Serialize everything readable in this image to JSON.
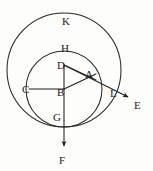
{
  "figure": {
    "background_color": "#fdfdfc",
    "ink_color": "#232020",
    "stroke_width": 1.0,
    "width": 153,
    "height": 171,
    "circles": [
      {
        "name": "outer-circle-K",
        "label": "K",
        "cx": 64,
        "cy": 70,
        "r": 57
      },
      {
        "name": "inner-circle-H",
        "label": "H",
        "cx": 64,
        "cy": 89,
        "r": 38
      }
    ],
    "points": [
      {
        "key": "K",
        "label": "K",
        "x": 62,
        "y": 16,
        "role": "outer-circle-label"
      },
      {
        "key": "H",
        "label": "H",
        "x": 61,
        "y": 43,
        "role": "inner-circle-label"
      },
      {
        "key": "D",
        "label": "D",
        "x": 57,
        "y": 60,
        "role": "vertex"
      },
      {
        "key": "A",
        "label": "A",
        "x": 85,
        "y": 69,
        "role": "vertex"
      },
      {
        "key": "C",
        "label": "C",
        "x": 22,
        "y": 84,
        "role": "vertex"
      },
      {
        "key": "B",
        "label": "B",
        "x": 57,
        "y": 87,
        "role": "center"
      },
      {
        "key": "L",
        "label": "L",
        "x": 110,
        "y": 88,
        "role": "intersection"
      },
      {
        "key": "E",
        "label": "E",
        "x": 134,
        "y": 100,
        "role": "ray-end"
      },
      {
        "key": "G",
        "label": "G",
        "x": 53,
        "y": 112,
        "role": "vertex"
      },
      {
        "key": "F",
        "label": "F",
        "x": 59,
        "y": 155,
        "role": "ray-end"
      }
    ],
    "segments": [
      {
        "name": "segment-d-b",
        "x1": 64,
        "y1": 65,
        "x2": 64,
        "y2": 89
      },
      {
        "name": "segment-b-g",
        "x1": 64,
        "y1": 89,
        "x2": 64,
        "y2": 120
      },
      {
        "name": "segment-c-b",
        "x1": 29,
        "y1": 89,
        "x2": 64,
        "y2": 89
      },
      {
        "name": "segment-d-a",
        "x1": 64,
        "y1": 65,
        "x2": 96,
        "y2": 80
      },
      {
        "name": "segment-b-a",
        "x1": 64,
        "y1": 89,
        "x2": 96,
        "y2": 74
      }
    ],
    "rays": [
      {
        "name": "ray-to-e",
        "x1": 64,
        "y1": 65,
        "x2": 131,
        "y2": 99,
        "arrow": true
      },
      {
        "name": "ray-to-f",
        "x1": 64,
        "y1": 120,
        "x2": 64,
        "y2": 150,
        "arrow": true
      }
    ]
  }
}
